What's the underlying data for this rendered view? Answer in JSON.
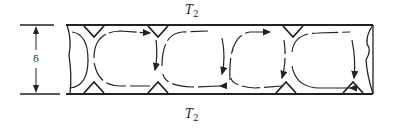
{
  "diagram": {
    "type": "convection-cells",
    "labels": {
      "top_temperature": {
        "symbol": "T",
        "subscript": "2"
      },
      "bottom_temperature": {
        "symbol": "T",
        "subscript": "2"
      },
      "layer_thickness": "δ"
    },
    "cells": 4,
    "line_color": "#222222"
  }
}
